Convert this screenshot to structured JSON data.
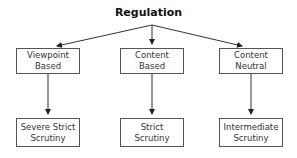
{
  "diagram": {
    "title": "Regulation",
    "categories": [
      {
        "label_line1": "Viewpoint",
        "label_line2": "Based",
        "scrutiny_line1": "Severe Strict",
        "scrutiny_line2": "Scrutiny"
      },
      {
        "label_line1": "Content",
        "label_line2": "Based",
        "scrutiny_line1": "Strict",
        "scrutiny_line2": "Scrutiny"
      },
      {
        "label_line1": "Content",
        "label_line2": "Neutral",
        "scrutiny_line1": "Intermediate",
        "scrutiny_line2": "Scrutiny"
      }
    ]
  }
}
